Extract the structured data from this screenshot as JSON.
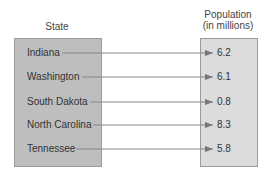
{
  "headers": {
    "domain": "State",
    "range_line1": "Population",
    "range_line2": "(in millions)"
  },
  "mapping": [
    {
      "state": "Indiana",
      "population": "6.2"
    },
    {
      "state": "Washington",
      "population": "6.1"
    },
    {
      "state": "South Dakota",
      "population": "0.8"
    },
    {
      "state": "North Carolina",
      "population": "8.3"
    },
    {
      "state": "Tennessee",
      "population": "5.8"
    }
  ],
  "colors": {
    "domain_box": "#bebebe",
    "range_box": "#dcdcdc",
    "arrow": "#777777"
  }
}
